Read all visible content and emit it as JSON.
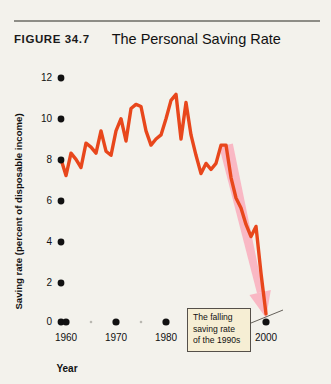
{
  "header": {
    "figure_number": "FIGURE 34.7",
    "title": "The Personal Saving Rate"
  },
  "annotation": {
    "line1": "The falling",
    "line2": "saving rate",
    "line3": "of the 1990s",
    "full_text": "The falling saving rate of the 1990s"
  },
  "colors": {
    "line": "#e8471c",
    "arrow": "#f9b8c4",
    "background": "#f3f2ec",
    "text": "#111111",
    "annotation_fill": "#f6eed4",
    "annotation_border": "#55504a",
    "rule": "#8d8d86"
  },
  "chart_data": {
    "type": "line",
    "title": "The Personal Saving Rate",
    "xlabel": "Year",
    "ylabel": "Saving rate (percent of disposable income)",
    "xlim": [
      1959,
      2001
    ],
    "ylim": [
      0,
      12
    ],
    "ytick_labels": [
      "0",
      "2",
      "4",
      "6",
      "8",
      "10",
      "12"
    ],
    "yticks": [
      0,
      2,
      4,
      6,
      8,
      10,
      12
    ],
    "xtick_labels": [
      "1960",
      "1970",
      "1980",
      "1990",
      "2000"
    ],
    "xticks": [
      1960,
      1970,
      1980,
      1990,
      2000
    ],
    "minor_xticks": [
      1965,
      1975,
      1985,
      1995
    ],
    "grid": false,
    "legend": null,
    "series": [
      {
        "name": "Personal saving rate",
        "x": [
          1959,
          1960,
          1961,
          1962,
          1963,
          1964,
          1965,
          1966,
          1967,
          1968,
          1969,
          1970,
          1971,
          1972,
          1973,
          1974,
          1975,
          1976,
          1977,
          1978,
          1979,
          1980,
          1981,
          1982,
          1983,
          1984,
          1985,
          1986,
          1987,
          1988,
          1989,
          1990,
          1991,
          1992,
          1993,
          1994,
          1995,
          1996,
          1997,
          1998,
          1999,
          2000
        ],
        "values": [
          8.0,
          7.2,
          8.3,
          8.0,
          7.6,
          8.8,
          8.6,
          8.3,
          9.4,
          8.4,
          8.2,
          9.4,
          10.0,
          8.9,
          10.5,
          10.7,
          10.6,
          9.4,
          8.7,
          9.0,
          9.2,
          10.0,
          10.9,
          11.2,
          9.0,
          10.8,
          9.2,
          8.2,
          7.3,
          7.8,
          7.5,
          7.8,
          8.7,
          8.7,
          7.1,
          6.1,
          5.6,
          4.8,
          4.2,
          4.7,
          2.4,
          0.4
        ]
      }
    ],
    "annotations": [
      {
        "text": "The falling saving rate of the 1990s",
        "points_to": "declining segment, 1992-2000"
      }
    ],
    "overlay_arrow": {
      "shape": "thick tapering arrow",
      "from": [
        1992,
        8.7
      ],
      "to": [
        2000,
        0.2
      ],
      "color": "#f9b8c4"
    }
  }
}
